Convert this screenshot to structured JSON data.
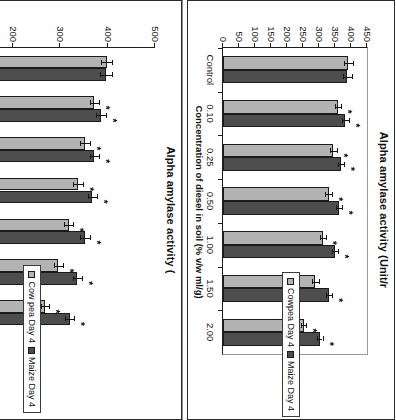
{
  "figure": {
    "orientation": "rotated-90-clockwise",
    "background": "#fefefe",
    "series_colors": {
      "cowpea": "#b3b3b3",
      "maize": "#4d4d4d"
    },
    "axis_color": "#1d1d1d"
  },
  "chart_data": [
    {
      "id": "left-chart",
      "type": "bar",
      "orientation": "horizontal-bars-rotated",
      "title": "Alpha amylase activity (",
      "title_note": "cropped at panel edge",
      "xlabel": "Concentration of diesel in soil (% v/w ml/g)",
      "ylabel": "Alpha amylase activity (",
      "ylim": [
        0,
        500
      ],
      "yticks": [
        0,
        100,
        200,
        300,
        400,
        500
      ],
      "ytick_labels": [
        "0",
        "100",
        "200",
        "300",
        "400",
        "500"
      ],
      "grid": false,
      "legend_position": "right",
      "categories": [
        "Control",
        "0.10",
        "0.25",
        "0.50",
        "1.00",
        "1.50",
        "2.00"
      ],
      "series": [
        {
          "name": "Cow pea Day 4",
          "color": "#b3b3b3",
          "values": [
            398,
            372,
            352,
            338,
            318,
            296,
            268
          ],
          "errors": [
            12,
            10,
            11,
            10,
            10,
            9,
            9
          ],
          "significance": [
            "",
            "*",
            "*",
            "*",
            "*",
            "*",
            "*"
          ]
        },
        {
          "name": "Maize Day 4",
          "color": "#4d4d4d",
          "values": [
            396,
            386,
            372,
            368,
            352,
            336,
            320
          ],
          "errors": [
            13,
            11,
            10,
            10,
            10,
            9,
            9
          ],
          "significance": [
            "",
            "*",
            "*",
            "*",
            "*",
            "*",
            "*"
          ]
        }
      ],
      "legend": [
        "Cow pea Day 4",
        "Maize Day 4"
      ]
    },
    {
      "id": "right-chart",
      "type": "bar",
      "orientation": "horizontal-bars-rotated",
      "title": "Alpha amylase activity (Unit/r",
      "title_note": "cropped at panel edge",
      "xlabel": "Concentration of diesel in soil (% v/w ml/g)",
      "ylabel": "Alpha amylase activity (Unit/r",
      "ylim": [
        0,
        450
      ],
      "yticks": [
        0,
        50,
        100,
        150,
        200,
        250,
        300,
        350,
        400,
        450
      ],
      "ytick_labels": [
        "0",
        "50",
        "100",
        "150",
        "200",
        "250",
        "300",
        "350",
        "400",
        "450"
      ],
      "grid": false,
      "legend_position": "right",
      "categories": [
        "Control",
        "0.10",
        "0.25",
        "0.50",
        "1.00",
        "1.50",
        "2.00"
      ],
      "series": [
        {
          "name": "Cowpea Day 4",
          "color": "#b3b3b3",
          "values": [
            392,
            360,
            345,
            330,
            312,
            288,
            252
          ],
          "errors": [
            14,
            10,
            11,
            10,
            10,
            11,
            8
          ],
          "significance": [
            "",
            "*",
            "*",
            "*",
            "*",
            "",
            "*"
          ]
        },
        {
          "name": "Maize Day 4",
          "color": "#4d4d4d",
          "values": [
            388,
            382,
            368,
            362,
            350,
            332,
            302
          ],
          "errors": [
            14,
            11,
            10,
            10,
            10,
            10,
            9
          ],
          "significance": [
            "",
            "*",
            "*",
            "*",
            "*",
            "*",
            "*"
          ]
        }
      ],
      "legend": [
        "Cowpea Day 4",
        "Maize Day 4"
      ]
    }
  ]
}
